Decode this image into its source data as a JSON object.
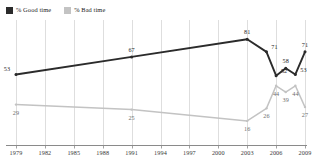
{
  "legend": {
    "entries": [
      {
        "label": "% Good time",
        "color": "#2b2b2b",
        "key": "good"
      },
      {
        "label": "% Bad time",
        "color": "#c3c3c3",
        "key": "bad"
      }
    ]
  },
  "axis": {
    "x_tick_labels": [
      "1979",
      "1982",
      "1985",
      "1988",
      "1991",
      "1994",
      "1997",
      "2000",
      "2003",
      "2006",
      "2009"
    ]
  },
  "chart_data": {
    "type": "line",
    "title": "",
    "subtitle": "",
    "xlabel": "",
    "ylabel": "",
    "xlim": [
      1979,
      2009
    ],
    "ylim": [
      0,
      90
    ],
    "grid": "vertical",
    "legend_position": "top-left",
    "x_tick_labels": [
      "1979",
      "1982",
      "1985",
      "1988",
      "1991",
      "1994",
      "1997",
      "2000",
      "2003",
      "2006",
      "2009"
    ],
    "series": [
      {
        "name": "% Good time",
        "color": "#2b2b2b",
        "points": [
          {
            "x": 1979,
            "y": 53,
            "label": "53",
            "label_pos": "left"
          },
          {
            "x": 1991,
            "y": 67,
            "label": "67",
            "label_pos": "above"
          },
          {
            "x": 2003,
            "y": 81,
            "label": "81",
            "label_pos": "above"
          },
          {
            "x": 2005,
            "y": 71,
            "label": "71",
            "label_pos": "right"
          },
          {
            "x": 2006,
            "y": 52,
            "label": "52",
            "label_pos": "right"
          },
          {
            "x": 2007,
            "y": 58,
            "label": "58",
            "label_pos": "above"
          },
          {
            "x": 2008,
            "y": 53,
            "label": "53",
            "label_pos": "right"
          },
          {
            "x": 2009,
            "y": 71,
            "label": "71",
            "label_pos": "above"
          }
        ]
      },
      {
        "name": "% Bad time",
        "color": "#c3c3c3",
        "points": [
          {
            "x": 1979,
            "y": 29,
            "label": "29",
            "label_pos": "below"
          },
          {
            "x": 1991,
            "y": 25,
            "label": "25",
            "label_pos": "below"
          },
          {
            "x": 2003,
            "y": 16,
            "label": "16",
            "label_pos": "below"
          },
          {
            "x": 2005,
            "y": 26,
            "label": "26",
            "label_pos": "below"
          },
          {
            "x": 2006,
            "y": 44,
            "label": "44",
            "label_pos": "below"
          },
          {
            "x": 2007,
            "y": 39,
            "label": "39",
            "label_pos": "below"
          },
          {
            "x": 2008,
            "y": 44,
            "label": "44",
            "label_pos": "below"
          },
          {
            "x": 2009,
            "y": 27,
            "label": "27",
            "label_pos": "below"
          }
        ]
      }
    ]
  }
}
